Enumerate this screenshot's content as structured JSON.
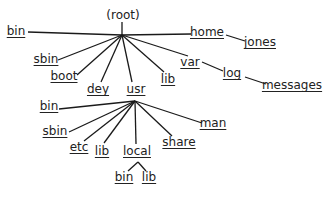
{
  "diagram": {
    "nodes": [
      {
        "id": "root",
        "label": "(root)",
        "x": 123,
        "y": 15,
        "dir": false
      },
      {
        "id": "bin",
        "label": "bin",
        "x": 16,
        "y": 31,
        "dir": true
      },
      {
        "id": "home",
        "label": "home",
        "x": 207,
        "y": 32,
        "dir": true
      },
      {
        "id": "jones",
        "label": "jones",
        "x": 260,
        "y": 42,
        "dir": true
      },
      {
        "id": "sbin",
        "label": "sbin",
        "x": 46,
        "y": 59,
        "dir": true
      },
      {
        "id": "boot",
        "label": "boot",
        "x": 64,
        "y": 76,
        "dir": true
      },
      {
        "id": "dey",
        "label": "dey",
        "x": 98,
        "y": 89,
        "dir": true
      },
      {
        "id": "usr",
        "label": "usr",
        "x": 136,
        "y": 89,
        "dir": true
      },
      {
        "id": "lib",
        "label": "lib",
        "x": 168,
        "y": 79,
        "dir": true
      },
      {
        "id": "var",
        "label": "var",
        "x": 190,
        "y": 62,
        "dir": true
      },
      {
        "id": "log",
        "label": "log",
        "x": 232,
        "y": 73,
        "dir": true
      },
      {
        "id": "messages",
        "label": "messages",
        "x": 292,
        "y": 85,
        "dir": true
      },
      {
        "id": "usr_bin",
        "label": "bin",
        "x": 49,
        "y": 106,
        "dir": true
      },
      {
        "id": "usr_sbin",
        "label": "sbin",
        "x": 55,
        "y": 131,
        "dir": true
      },
      {
        "id": "usr_etc",
        "label": "etc",
        "x": 79,
        "y": 147,
        "dir": true
      },
      {
        "id": "usr_lib",
        "label": "lib",
        "x": 102,
        "y": 151,
        "dir": true
      },
      {
        "id": "usr_local",
        "label": "local",
        "x": 137,
        "y": 151,
        "dir": true
      },
      {
        "id": "usr_share",
        "label": "share",
        "x": 179,
        "y": 142,
        "dir": true
      },
      {
        "id": "usr_man",
        "label": "man",
        "x": 213,
        "y": 123,
        "dir": true
      },
      {
        "id": "local_bin",
        "label": "bin",
        "x": 124,
        "y": 177,
        "dir": true
      },
      {
        "id": "local_lib",
        "label": "lib",
        "x": 149,
        "y": 177,
        "dir": true
      }
    ],
    "edges": [
      {
        "from": "root",
        "to": "bin",
        "x1": 122,
        "y1": 35,
        "x2": 28,
        "y2": 32
      },
      {
        "from": "root",
        "to": "home",
        "x1": 122,
        "y1": 35,
        "x2": 191,
        "y2": 34
      },
      {
        "from": "root",
        "to": "sbin",
        "x1": 122,
        "y1": 35,
        "x2": 58,
        "y2": 60
      },
      {
        "from": "root",
        "to": "boot",
        "x1": 122,
        "y1": 35,
        "x2": 77,
        "y2": 75
      },
      {
        "from": "root",
        "to": "dey",
        "x1": 122,
        "y1": 35,
        "x2": 101,
        "y2": 82
      },
      {
        "from": "root",
        "to": "usr",
        "x1": 122,
        "y1": 35,
        "x2": 132,
        "y2": 82
      },
      {
        "from": "root",
        "to": "lib",
        "x1": 122,
        "y1": 35,
        "x2": 164,
        "y2": 72
      },
      {
        "from": "root",
        "to": "var",
        "x1": 122,
        "y1": 35,
        "x2": 188,
        "y2": 56
      },
      {
        "from": "home",
        "to": "jones",
        "x1": 226,
        "y1": 35,
        "x2": 245,
        "y2": 41
      },
      {
        "from": "var",
        "to": "log",
        "x1": 202,
        "y1": 62,
        "x2": 223,
        "y2": 71
      },
      {
        "from": "log",
        "to": "messages",
        "x1": 245,
        "y1": 77,
        "x2": 266,
        "y2": 84
      },
      {
        "from": "usr",
        "to": "usr_bin",
        "x1": 135,
        "y1": 101,
        "x2": 59,
        "y2": 109
      },
      {
        "from": "usr",
        "to": "usr_sbin",
        "x1": 135,
        "y1": 101,
        "x2": 69,
        "y2": 132
      },
      {
        "from": "usr",
        "to": "usr_etc",
        "x1": 135,
        "y1": 101,
        "x2": 84,
        "y2": 141
      },
      {
        "from": "usr",
        "to": "usr_lib",
        "x1": 135,
        "y1": 101,
        "x2": 104,
        "y2": 143
      },
      {
        "from": "usr",
        "to": "usr_local",
        "x1": 135,
        "y1": 101,
        "x2": 136,
        "y2": 144
      },
      {
        "from": "usr",
        "to": "usr_share",
        "x1": 135,
        "y1": 101,
        "x2": 172,
        "y2": 136
      },
      {
        "from": "usr",
        "to": "usr_man",
        "x1": 135,
        "y1": 101,
        "x2": 202,
        "y2": 123
      },
      {
        "from": "local_jct",
        "to": "local_bin",
        "x1": 138,
        "y1": 162,
        "x2": 128,
        "y2": 171
      },
      {
        "from": "local_jct",
        "to": "local_lib",
        "x1": 138,
        "y1": 162,
        "x2": 146,
        "y2": 171
      },
      {
        "from": "root_label",
        "to": "root",
        "x1": 122,
        "y1": 22,
        "x2": 122,
        "y2": 35
      }
    ],
    "colors": {
      "line": "#1a1a1a",
      "text": "#222222",
      "background": "#ffffff"
    }
  }
}
